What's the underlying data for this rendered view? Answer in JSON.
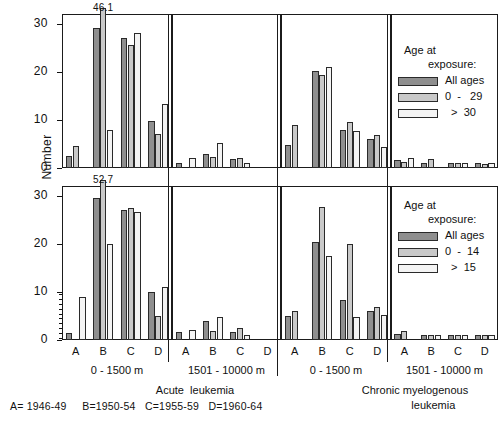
{
  "axis": {
    "ylabel": "Number",
    "yticks_top": [
      "30",
      "20",
      "10",
      "0"
    ],
    "yticks_bottom": [
      "30",
      "20",
      "10",
      "0"
    ],
    "ylim": [
      0,
      32
    ],
    "xcategories": [
      "A",
      "B",
      "C",
      "D"
    ]
  },
  "xgroups": [
    {
      "label": "0 - 1500 m"
    },
    {
      "label": "1501 - 10000 m"
    },
    {
      "label": "0 - 1500 m"
    },
    {
      "label": "1501 - 10000 m"
    }
  ],
  "diseases": [
    {
      "label": "Acute  leukemia"
    },
    {
      "label": "Chronic myelogenous\n            leukemia"
    }
  ],
  "footnote": "A= 1946-49     B=1950-54   C=1955-59   D=1960-64",
  "legends": [
    {
      "title_line1": "Age at",
      "title_line2": "exposure:",
      "entries": [
        {
          "label": "All ages",
          "color": "#8f8f8f"
        },
        {
          "label": "0  -   29",
          "color": "#c9c9c9"
        },
        {
          "label": "  >  30",
          "color": "#f4f4f4"
        }
      ]
    },
    {
      "title_line1": "Age at",
      "title_line2": "exposure:",
      "entries": [
        {
          "label": "All ages",
          "color": "#8f8f8f"
        },
        {
          "label": "0  -  14",
          "color": "#c9c9c9"
        },
        {
          "label": "  >  15",
          "color": "#f4f4f4"
        }
      ]
    }
  ],
  "annotations": [
    {
      "text": "46.1",
      "panel": 0,
      "series": 1,
      "category": "B"
    },
    {
      "text": "52.7",
      "panel": 4,
      "series": 1,
      "category": "B"
    }
  ],
  "chart_data": {
    "type": "bar",
    "title": "",
    "xlabel": "",
    "ylabel": "Number",
    "ylim": [
      0,
      32
    ],
    "grid": false,
    "legend_position": "right",
    "categories": [
      "A",
      "B",
      "C",
      "D"
    ],
    "category_meaning": {
      "A": "1946-49",
      "B": "1950-54",
      "C": "1955-59",
      "D": "1960-64"
    },
    "panels": [
      {
        "row": "top",
        "disease": "Acute leukemia",
        "distance": "0 - 1500 m",
        "series": [
          {
            "name": "All ages",
            "values": [
              2.5,
              29.0,
              27.0,
              9.7
            ]
          },
          {
            "name": "0 - 29",
            "values": [
              4.5,
              46.1,
              25.5,
              7.0
            ]
          },
          {
            "name": "> 30",
            "values": [
              0.0,
              8.0,
              28.0,
              13.3
            ]
          }
        ],
        "clipped": [
          {
            "category": "B",
            "series": "0 - 29",
            "value": 46.1
          }
        ]
      },
      {
        "row": "top",
        "disease": "Acute leukemia",
        "distance": "1501 - 10000 m",
        "series": [
          {
            "name": "All ages",
            "values": [
              1.0,
              3.0,
              1.8,
              0.0
            ]
          },
          {
            "name": "0 - 29",
            "values": [
              0.0,
              2.3,
              2.0,
              0.0
            ]
          },
          {
            "name": "> 30",
            "values": [
              2.0,
              5.2,
              1.0,
              0.0
            ]
          }
        ],
        "clipped": []
      },
      {
        "row": "top",
        "disease": "Chronic myelogenous leukemia",
        "distance": "0 - 1500 m",
        "series": [
          {
            "name": "All ages",
            "values": [
              4.7,
              20.2,
              8.0,
              6.0
            ]
          },
          {
            "name": "0 - 29",
            "values": [
              9.0,
              19.3,
              9.6,
              6.8
            ]
          },
          {
            "name": "> 30",
            "values": [
              0.0,
              21.0,
              7.7,
              4.4
            ]
          }
        ],
        "clipped": []
      },
      {
        "row": "top",
        "disease": "Chronic myelogenous leukemia",
        "distance": "1501 - 10000 m",
        "series": [
          {
            "name": "All ages",
            "values": [
              1.6,
              1.0,
              1.0,
              1.0
            ]
          },
          {
            "name": "0 - 29",
            "values": [
              1.3,
              1.8,
              1.0,
              0.8
            ]
          },
          {
            "name": "> 30",
            "values": [
              2.0,
              0.0,
              1.0,
              1.0
            ]
          }
        ],
        "clipped": []
      },
      {
        "row": "bottom",
        "disease": "Acute leukemia",
        "distance": "0 - 1500 m",
        "series": [
          {
            "name": "All ages",
            "values": [
              1.5,
              29.5,
              27.0,
              10.0
            ]
          },
          {
            "name": "0 - 14",
            "values": [
              0.0,
              52.7,
              27.5,
              5.0
            ]
          },
          {
            "name": "> 15",
            "values": [
              9.0,
              20.0,
              26.5,
              11.0
            ]
          }
        ],
        "clipped": [
          {
            "category": "B",
            "series": "0 - 14",
            "value": 52.7
          }
        ]
      },
      {
        "row": "bottom",
        "disease": "Acute leukemia",
        "distance": "1501 - 10000 m",
        "series": [
          {
            "name": "All ages",
            "values": [
              1.7,
              4.0,
              1.7,
              0.0
            ]
          },
          {
            "name": "0 - 14",
            "values": [
              0.0,
              1.8,
              2.6,
              0.0
            ]
          },
          {
            "name": "> 15",
            "values": [
              2.1,
              4.8,
              1.0,
              0.0
            ]
          }
        ],
        "clipped": []
      },
      {
        "row": "bottom",
        "disease": "Chronic myelogenous leukemia",
        "distance": "0 - 1500 m",
        "series": [
          {
            "name": "All ages",
            "values": [
              4.9,
              20.3,
              8.4,
              6.0
            ]
          },
          {
            "name": "0 - 14",
            "values": [
              6.1,
              27.7,
              20.0,
              6.8
            ]
          },
          {
            "name": "> 15",
            "values": [
              0.0,
              17.5,
              4.7,
              5.3
            ]
          }
        ],
        "clipped": []
      },
      {
        "row": "bottom",
        "disease": "Chronic myelogenous leukemia",
        "distance": "1501 - 10000 m",
        "series": [
          {
            "name": "All ages",
            "values": [
              1.3,
              1.0,
              1.0,
              1.0
            ]
          },
          {
            "name": "0 - 14",
            "values": [
              1.9,
              1.0,
              1.0,
              1.0
            ]
          },
          {
            "name": "> 15",
            "values": [
              0.0,
              1.0,
              1.0,
              1.0
            ]
          }
        ],
        "clipped": []
      }
    ]
  }
}
